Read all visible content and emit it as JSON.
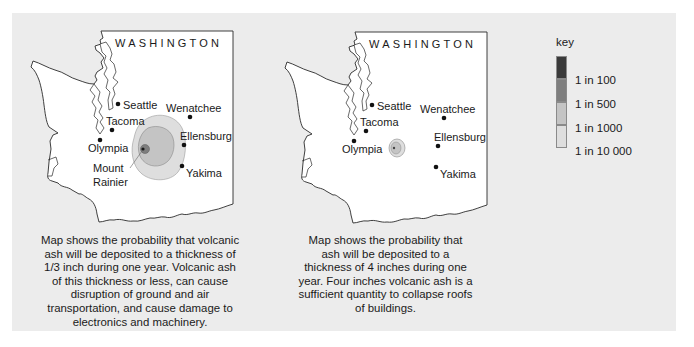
{
  "maps": [
    {
      "id": "left",
      "state_label": "WASHINGTON",
      "cities": [
        {
          "name": "Seattle"
        },
        {
          "name": "Tacoma"
        },
        {
          "name": "Olympia"
        },
        {
          "name": "Wenatchee"
        },
        {
          "name": "Ellensburg"
        },
        {
          "name": "Yakima"
        }
      ],
      "volcano": {
        "line1": "Mount",
        "line2": "Rainier"
      },
      "caption": "Map shows the probability that volcanic ash will be deposited to a thickness of 1/3 inch during one year. Volcanic ash of this thickness or less, can cause disruption of ground and air transportation, and cause damage to electronics and machinery."
    },
    {
      "id": "right",
      "state_label": "WASHINGTON",
      "cities": [
        {
          "name": "Seattle"
        },
        {
          "name": "Tacoma"
        },
        {
          "name": "Olympia"
        },
        {
          "name": "Wenatchee"
        },
        {
          "name": "Ellensburg"
        },
        {
          "name": "Yakima"
        }
      ],
      "caption": "Map shows the probability that ash will be deposited to a thickness of 4 inches during one year. Four inches volcanic ash is a sufficient quantity to collapse roofs of buildings."
    }
  ],
  "key": {
    "title": "key",
    "items": [
      {
        "label": "1 in 100",
        "color": "#3a3a3a"
      },
      {
        "label": "1 in 500",
        "color": "#7e7e7e"
      },
      {
        "label": "1 in 1000",
        "color": "#c4c4c4"
      },
      {
        "label": "1 in 10 000",
        "color": "#dedede"
      }
    ]
  },
  "colors": {
    "panel": "#ececec",
    "land": "#ffffff",
    "outline": "#2a2a2a",
    "zone_1_in_10000": "#dedede",
    "zone_1_in_1000": "#c4c4c4",
    "zone_1_in_500": "#7e7e7e",
    "zone_1_in_100": "#3a3a3a"
  }
}
